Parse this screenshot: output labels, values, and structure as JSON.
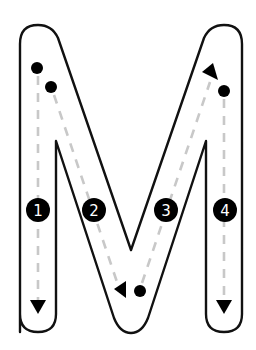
{
  "worksheet": {
    "letter": "M",
    "colors": {
      "outline": "#111111",
      "guide": "#c8c8c8",
      "marker": "#000000",
      "number_text": "#ffffff",
      "background": "#ffffff"
    },
    "strokes": [
      {
        "number": "1",
        "direction": "down",
        "label": "1"
      },
      {
        "number": "2",
        "direction": "diagonal-down-right",
        "label": "2"
      },
      {
        "number": "3",
        "direction": "diagonal-up-right",
        "label": "3"
      },
      {
        "number": "4",
        "direction": "down",
        "label": "4"
      }
    ]
  }
}
